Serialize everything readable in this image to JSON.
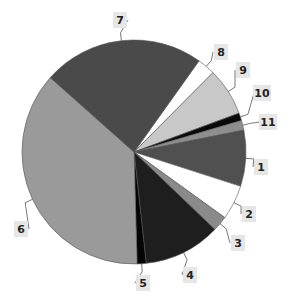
{
  "chart_data": {
    "type": "pie",
    "title": "",
    "start_angle_deg": 35.5,
    "direction": "clockwise",
    "categories": [
      "8",
      "9",
      "10",
      "11",
      "1",
      "2",
      "3",
      "4",
      "5",
      "6",
      "7"
    ],
    "slices": [
      {
        "label": "8",
        "value": 2.6,
        "color": "#ffffff"
      },
      {
        "label": "9",
        "value": 6.9,
        "color": "#c8c8c8"
      },
      {
        "label": "10",
        "value": 1.1,
        "color": "#0a0a0a"
      },
      {
        "label": "11",
        "value": 1.4,
        "color": "#8e8e8e"
      },
      {
        "label": "1",
        "value": 8.1,
        "color": "#505050"
      },
      {
        "label": "2",
        "value": 5.0,
        "color": "#ffffff"
      },
      {
        "label": "3",
        "value": 2.2,
        "color": "#8a8a8a"
      },
      {
        "label": "4",
        "value": 11.1,
        "color": "#1e1e1e"
      },
      {
        "label": "5",
        "value": 1.3,
        "color": "#050505"
      },
      {
        "label": "6",
        "value": 37.0,
        "color": "#9a9a9a"
      },
      {
        "label": "7",
        "value": 23.3,
        "color": "#4a4a4a"
      }
    ],
    "legend": "none",
    "data_labels": "slice numbers with leader lines"
  },
  "labels": {
    "7": {
      "text": "7",
      "x": 120,
      "y": 20
    },
    "8": {
      "text": "8",
      "x": 221,
      "y": 52
    },
    "9": {
      "text": "9",
      "x": 243,
      "y": 70
    },
    "10": {
      "text": "10",
      "x": 262,
      "y": 93
    },
    "11": {
      "text": "11",
      "x": 268,
      "y": 122
    },
    "1": {
      "text": "1",
      "x": 261,
      "y": 167
    },
    "2": {
      "text": "2",
      "x": 249,
      "y": 214
    },
    "3": {
      "text": "3",
      "x": 238,
      "y": 243
    },
    "4": {
      "text": "4",
      "x": 190,
      "y": 275
    },
    "5": {
      "text": "5",
      "x": 143,
      "y": 283
    },
    "6": {
      "text": "6",
      "x": 21,
      "y": 229
    }
  }
}
